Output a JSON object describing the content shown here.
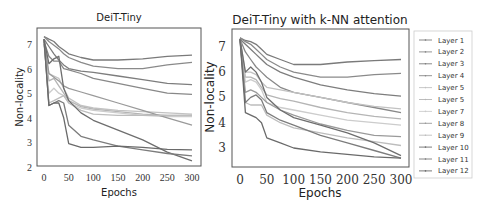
{
  "chart_data": [
    {
      "type": "line",
      "title": "DeiT-Tiny",
      "xlabel": "Epochs",
      "ylabel": "Non-locality",
      "xlim": [
        0,
        300
      ],
      "ylim": [
        2,
        7.4
      ],
      "xticks": [
        "0",
        "50",
        "100",
        "150",
        "200",
        "250",
        "300"
      ],
      "yticks": [
        "2",
        "3",
        "4",
        "5",
        "6",
        "7"
      ],
      "grid": false,
      "x": [
        0,
        10,
        20,
        30,
        40,
        50,
        75,
        100,
        150,
        200,
        250,
        300
      ],
      "series": [
        {
          "name": "Layer 1",
          "values": [
            7.3,
            7.2,
            7.1,
            6.9,
            6.75,
            6.6,
            6.45,
            6.35,
            6.35,
            6.4,
            6.5,
            6.55
          ]
        },
        {
          "name": "Layer 2",
          "values": [
            7.3,
            7.1,
            6.95,
            6.8,
            6.6,
            6.45,
            6.25,
            6.1,
            6.0,
            6.0,
            6.15,
            6.25
          ]
        },
        {
          "name": "Layer 3",
          "values": [
            7.2,
            6.9,
            6.6,
            6.35,
            6.15,
            6.0,
            5.9,
            5.85,
            5.7,
            5.55,
            5.4,
            5.35
          ]
        },
        {
          "name": "Layer 4",
          "values": [
            7.1,
            6.5,
            6.3,
            6.3,
            6.0,
            5.95,
            5.8,
            5.6,
            5.4,
            5.2,
            5.0,
            4.95
          ]
        },
        {
          "name": "Layer 5",
          "values": [
            7.0,
            5.8,
            5.7,
            5.6,
            5.2,
            4.8,
            4.5,
            4.4,
            4.3,
            4.25,
            4.2,
            4.15
          ]
        },
        {
          "name": "Layer 6",
          "values": [
            7.0,
            5.5,
            5.6,
            5.3,
            5.0,
            4.7,
            4.45,
            4.35,
            4.25,
            4.15,
            4.1,
            4.1
          ]
        },
        {
          "name": "Layer 7",
          "values": [
            7.0,
            5.0,
            5.2,
            5.0,
            4.9,
            4.6,
            4.4,
            4.3,
            4.2,
            4.1,
            4.05,
            4.05
          ]
        },
        {
          "name": "Layer 8",
          "values": [
            7.2,
            5.8,
            5.65,
            5.5,
            5.3,
            5.2,
            5.05,
            4.9,
            4.6,
            4.3,
            4.0,
            3.7
          ]
        },
        {
          "name": "Layer 9",
          "values": [
            7.2,
            4.6,
            4.7,
            4.8,
            4.9,
            4.6,
            4.3,
            4.15,
            4.1,
            4.1,
            4.1,
            4.1
          ]
        },
        {
          "name": "Layer 10",
          "values": [
            7.2,
            6.2,
            6.4,
            6.5,
            5.2,
            4.7,
            4.2,
            3.9,
            3.5,
            3.1,
            2.6,
            2.25
          ]
        },
        {
          "name": "Layer 11",
          "values": [
            7.2,
            4.5,
            4.6,
            4.7,
            4.6,
            3.7,
            3.25,
            3.1,
            2.85,
            2.7,
            2.55,
            2.45
          ]
        },
        {
          "name": "Layer 12",
          "values": [
            7.2,
            4.5,
            4.6,
            4.6,
            4.0,
            2.95,
            2.8,
            2.8,
            2.85,
            2.8,
            2.72,
            2.7
          ]
        }
      ]
    },
    {
      "type": "line",
      "title": "DeiT-Tiny with k-NN attention",
      "xlabel": "Epochs",
      "ylabel": "Non-locality",
      "xlim": [
        0,
        300
      ],
      "ylim": [
        2.2,
        7.4
      ],
      "xticks": [
        "0",
        "50",
        "100",
        "150",
        "200",
        "250",
        "300"
      ],
      "yticks": [
        "3",
        "4",
        "5",
        "6",
        "7"
      ],
      "grid": false,
      "x": [
        0,
        10,
        20,
        30,
        40,
        50,
        75,
        100,
        150,
        200,
        250,
        300
      ],
      "series": [
        {
          "name": "Layer 1",
          "values": [
            7.35,
            7.25,
            7.2,
            7.1,
            6.9,
            6.7,
            6.5,
            6.3,
            6.3,
            6.4,
            6.45,
            6.5
          ]
        },
        {
          "name": "Layer 2",
          "values": [
            7.35,
            7.2,
            7.1,
            6.9,
            6.7,
            6.5,
            6.2,
            6.0,
            5.8,
            5.8,
            5.9,
            5.95
          ]
        },
        {
          "name": "Layer 3",
          "values": [
            7.3,
            7.1,
            6.9,
            6.7,
            6.5,
            6.3,
            6.0,
            5.8,
            5.5,
            5.3,
            5.15,
            5.05
          ]
        },
        {
          "name": "Layer 4",
          "values": [
            7.3,
            6.8,
            6.5,
            6.2,
            6.0,
            5.8,
            5.4,
            5.2,
            5.0,
            4.8,
            4.6,
            4.4
          ]
        },
        {
          "name": "Layer 5",
          "values": [
            7.3,
            6.0,
            6.0,
            5.9,
            5.6,
            5.4,
            5.3,
            5.2,
            5.0,
            4.8,
            4.65,
            4.55
          ]
        },
        {
          "name": "Layer 6",
          "values": [
            7.3,
            5.8,
            5.8,
            5.7,
            5.4,
            5.1,
            4.95,
            4.85,
            4.6,
            4.4,
            4.25,
            4.15
          ]
        },
        {
          "name": "Layer 7",
          "values": [
            7.3,
            5.6,
            5.7,
            5.6,
            5.3,
            4.8,
            4.6,
            4.5,
            4.3,
            4.1,
            4.0,
            3.9
          ]
        },
        {
          "name": "Layer 8",
          "values": [
            7.3,
            5.2,
            5.3,
            5.2,
            5.0,
            4.8,
            4.5,
            4.3,
            3.95,
            3.7,
            3.5,
            3.45
          ]
        },
        {
          "name": "Layer 9",
          "values": [
            7.3,
            4.8,
            4.7,
            4.7,
            4.7,
            4.3,
            4.0,
            3.8,
            3.6,
            3.4,
            3.25,
            3.1
          ]
        },
        {
          "name": "Layer 10",
          "values": [
            7.3,
            6.0,
            6.2,
            6.0,
            5.6,
            5.0,
            4.5,
            4.2,
            3.9,
            3.6,
            3.2,
            2.7
          ]
        },
        {
          "name": "Layer 11",
          "values": [
            7.3,
            4.8,
            5.0,
            5.1,
            4.9,
            4.4,
            4.1,
            3.9,
            3.5,
            3.2,
            2.9,
            2.6
          ]
        },
        {
          "name": "Layer 12",
          "values": [
            7.3,
            4.4,
            4.3,
            4.2,
            4.0,
            3.4,
            3.2,
            3.0,
            2.85,
            2.75,
            2.65,
            2.6
          ]
        }
      ]
    }
  ],
  "legend": {
    "position": "right",
    "entries": [
      "Layer 1",
      "Layer 2",
      "Layer 3",
      "Layer 4",
      "Layer 5",
      "Layer 5",
      "Layer 7",
      "Layer 8",
      "Layer 9",
      "Layer 10",
      "Layer 11",
      "Layer 12"
    ]
  },
  "colors": {
    "series": [
      "#7a7a7a",
      "#8a8a8a",
      "#7d7d7d",
      "#888888",
      "#c2c2c2",
      "#b5b5b5",
      "#cccccc",
      "#9a9a9a",
      "#bdbdbd",
      "#6e6e6e",
      "#7c7c7c",
      "#6a6a6a"
    ],
    "axis": "#555555"
  }
}
